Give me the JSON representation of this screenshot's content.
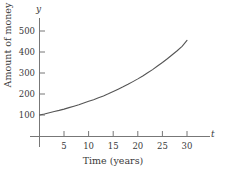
{
  "chart_data": {
    "type": "line",
    "title": "",
    "subtitle": "",
    "xlabel": "Time (years)",
    "ylabel": "Amount of money",
    "x_axis_symbol": "t",
    "y_axis_symbol": "y",
    "xlim": [
      0,
      34
    ],
    "ylim": [
      0,
      560
    ],
    "xticks": [
      5,
      10,
      15,
      20,
      25,
      30
    ],
    "xtick_labels": [
      "5",
      "10",
      "15",
      "20",
      "25",
      "30"
    ],
    "yticks": [
      100,
      200,
      300,
      400,
      500
    ],
    "ytick_labels": [
      "100",
      "200",
      "300",
      "400",
      "500"
    ],
    "grid": false,
    "legend": "none",
    "curve_color": "#555555",
    "axis_color": "#777777",
    "text_color": "#3a3a3a",
    "series": [
      {
        "name": "Amount of money",
        "x": [
          0,
          1,
          2,
          3,
          4,
          5,
          6,
          7,
          8,
          9,
          10,
          11,
          12,
          13,
          14,
          15,
          16,
          17,
          18,
          19,
          20,
          21,
          22,
          23,
          24,
          25,
          26,
          27,
          28,
          29,
          30
        ],
        "values": [
          100,
          105,
          111,
          117,
          122,
          128,
          135,
          142,
          149,
          157,
          165,
          173,
          182,
          191,
          201,
          212,
          223,
          234,
          246,
          259,
          272,
          286,
          301,
          316,
          333,
          350,
          368,
          387,
          406,
          427,
          455
        ]
      }
    ],
    "annotations": []
  }
}
